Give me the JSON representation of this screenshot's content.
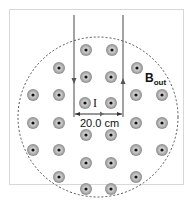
{
  "diagram": {
    "current_label": "I",
    "distance_label": "20.0 cm",
    "field_label": "B",
    "field_subscript": "out",
    "colors": {
      "dot_ring": "#8a8a8a",
      "dot_center": "#111111",
      "wire": "#666666",
      "circle": "#555555",
      "frame": "#d8d8d8"
    },
    "dots": [
      [
        86,
        50
      ],
      [
        112,
        50
      ],
      [
        59,
        68
      ],
      [
        137,
        68
      ],
      [
        86,
        77
      ],
      [
        111,
        77
      ],
      [
        33,
        95
      ],
      [
        59,
        95
      ],
      [
        136,
        95
      ],
      [
        162,
        95
      ],
      [
        85,
        103
      ],
      [
        111,
        103
      ],
      [
        33,
        123
      ],
      [
        59,
        123
      ],
      [
        136,
        123
      ],
      [
        162,
        123
      ],
      [
        86,
        135
      ],
      [
        111,
        135
      ],
      [
        33,
        150
      ],
      [
        59,
        150
      ],
      [
        136,
        150
      ],
      [
        162,
        150
      ],
      [
        86,
        163
      ],
      [
        111,
        163
      ],
      [
        59,
        177
      ],
      [
        136,
        177
      ],
      [
        86,
        189
      ],
      [
        111,
        189
      ]
    ]
  }
}
